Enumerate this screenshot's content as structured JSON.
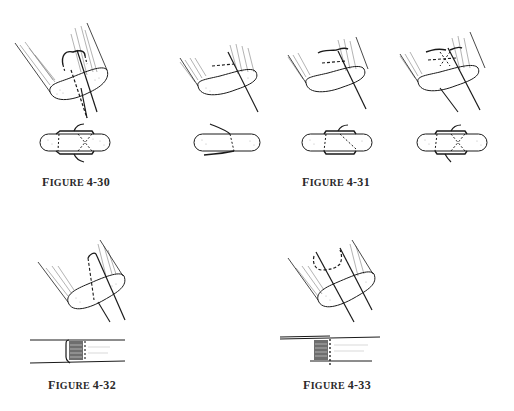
{
  "page": {
    "background": "#ffffff",
    "ink_color": "#1a1a1a"
  },
  "figures": [
    {
      "id": "4-30",
      "caption_first": "F",
      "caption_rest": "IGURE",
      "caption_number": "4-30",
      "panels": 1,
      "description": "Suture through cut tendon end, top oblique view and bottom end-on view"
    },
    {
      "id": "4-31",
      "caption_first": "F",
      "caption_rest": "IGURE",
      "caption_number": "4-31",
      "panels": 3,
      "description": "Three-step suture sequence, oblique views above and end-on views below"
    },
    {
      "id": "4-32",
      "caption_first": "F",
      "caption_rest": "IGURE",
      "caption_number": "4-32",
      "panels": 1,
      "description": "Single loop suture through tendon end, oblique view and side view"
    },
    {
      "id": "4-33",
      "caption_first": "F",
      "caption_rest": "IGURE",
      "caption_number": "4-33",
      "panels": 1,
      "description": "Double loop suture through tendon end, oblique view and side view"
    }
  ]
}
